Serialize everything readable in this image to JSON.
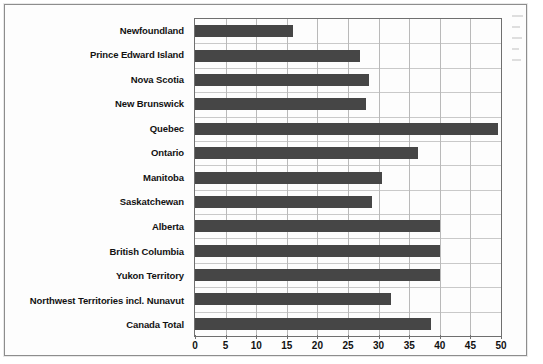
{
  "chart_data": {
    "type": "bar",
    "orientation": "horizontal",
    "title": "",
    "subtitle": "",
    "xlabel": "",
    "ylabel": "",
    "xlim": [
      0,
      50
    ],
    "xticks": [
      0,
      5,
      10,
      15,
      20,
      25,
      30,
      35,
      40,
      45,
      50
    ],
    "grid": true,
    "legend": false,
    "bar_color": "#464646",
    "plot_background": "#fdfdfd",
    "grid_color": "#c0c0c0",
    "axis_color": "#6f6f6f",
    "categories": [
      "Newfoundland",
      "Prince Edward Island",
      "Nova Scotia",
      "New Brunswick",
      "Quebec",
      "Ontario",
      "Manitoba",
      "Saskatchewan",
      "Alberta",
      "British Columbia",
      "Yukon Territory",
      "Northwest Territories incl. Nunavut",
      "Canada Total"
    ],
    "values": [
      16,
      27,
      28.5,
      28,
      49.5,
      36.5,
      30.5,
      29,
      40,
      40,
      40,
      32,
      38.5
    ]
  },
  "page": {
    "bleed_marks": 5
  }
}
